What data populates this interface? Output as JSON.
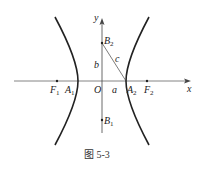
{
  "caption": "图 5-3",
  "axes": {
    "x_label": "x",
    "y_label": "y",
    "origin_label": "O"
  },
  "points": {
    "F1": {
      "label": "F",
      "sub": "1"
    },
    "F2": {
      "label": "F",
      "sub": "2"
    },
    "A1": {
      "label": "A",
      "sub": "1"
    },
    "A2": {
      "label": "A",
      "sub": "2"
    },
    "B1": {
      "label": "B",
      "sub": "1"
    },
    "B2": {
      "label": "B",
      "sub": "2"
    }
  },
  "segments": {
    "a": "a",
    "b": "b",
    "c": "c"
  },
  "colors": {
    "stroke": "#222222",
    "axis": "#555555"
  }
}
